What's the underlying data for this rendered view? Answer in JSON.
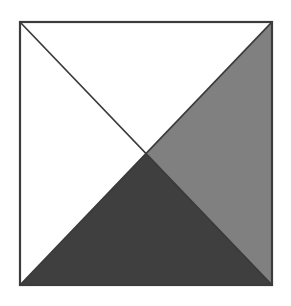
{
  "figure": {
    "title": "Square divided by both diagonals into four triangles",
    "canvas": {
      "width": 291,
      "height": 306,
      "background_color": "#ffffff"
    },
    "square": {
      "left": 20,
      "top": 22,
      "right": 272,
      "bottom": 285,
      "width": 252,
      "height": 263,
      "border_color": "#3c3c3c",
      "border_width": 2.2,
      "corners": {
        "top_left": [
          20,
          22
        ],
        "top_right": [
          272,
          22
        ],
        "bottom_right": [
          272,
          285
        ],
        "bottom_left": [
          20,
          285
        ]
      }
    },
    "center_point": {
      "x": 146,
      "y": 153.5,
      "label": "diagonal-intersection"
    },
    "diagonals": [
      {
        "name": "main-diagonal",
        "from": [
          20,
          22
        ],
        "to": [
          272,
          285
        ],
        "stroke_color": "#3a3a3a",
        "stroke_width": 1.6
      },
      {
        "name": "anti-diagonal",
        "from": [
          20,
          285
        ],
        "to": [
          272,
          22
        ],
        "stroke_color": "#3a3a3a",
        "stroke_width": 1.6
      }
    ],
    "regions": [
      {
        "name": "top-triangle",
        "position": "north",
        "points": "20,22 272,22 146,153.5",
        "fill_color": "#ffffff",
        "shade": "white"
      },
      {
        "name": "left-triangle",
        "position": "west",
        "points": "20,22 146,153.5 20,285",
        "fill_color": "#ffffff",
        "shade": "white"
      },
      {
        "name": "right-triangle",
        "position": "east",
        "points": "272,22 272,285 146,153.5",
        "fill_color": "#808080",
        "shade": "medium gray"
      },
      {
        "name": "bottom-triangle",
        "position": "south",
        "points": "20,285 272,285 146,153.5",
        "fill_color": "#3f3f3f",
        "shade": "dark gray"
      }
    ]
  }
}
